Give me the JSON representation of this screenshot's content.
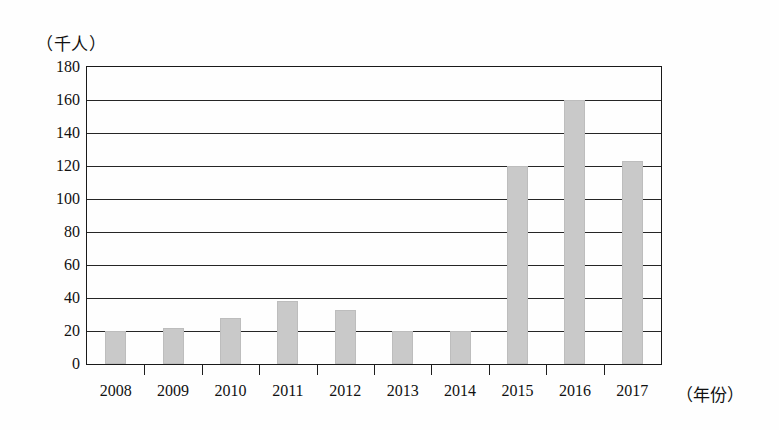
{
  "chart_data": {
    "type": "bar",
    "title": "",
    "subtitle": "",
    "xlabel": "（年份）",
    "ylabel": "（千人）",
    "categories": [
      "2008",
      "2009",
      "2010",
      "2011",
      "2012",
      "2013",
      "2014",
      "2015",
      "2016",
      "2017"
    ],
    "values": [
      20,
      22,
      28,
      38,
      33,
      20,
      20,
      120,
      160,
      123
    ],
    "series": [
      {
        "name": "",
        "values": [
          20,
          22,
          28,
          38,
          33,
          20,
          20,
          120,
          160,
          123
        ]
      }
    ],
    "ylim": [
      0,
      180
    ],
    "ytick_values": [
      0,
      20,
      40,
      60,
      80,
      100,
      120,
      140,
      160,
      180
    ],
    "ytick_labels": [
      "0",
      "20",
      "40",
      "60",
      "80",
      "100",
      "120",
      "140",
      "160",
      "180"
    ],
    "ytick_step": 20,
    "xtick_labels": [
      "2008",
      "2009",
      "2010",
      "2011",
      "2012",
      "2013",
      "2014",
      "2015",
      "2016",
      "2017"
    ],
    "grid": true,
    "grid_axis": "y",
    "legend": false,
    "legend_position": "none",
    "bar_color": "#c9c9c9",
    "axis_color": "#1a1a1a",
    "background_color": "#fefefe",
    "annotations": []
  }
}
